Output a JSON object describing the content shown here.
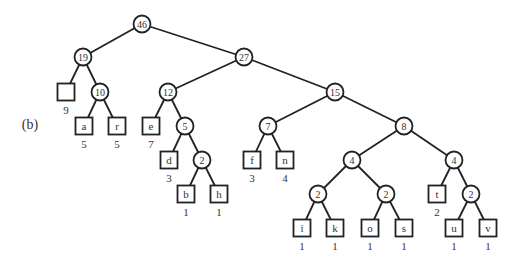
{
  "figure": {
    "part_label": "(b)",
    "kind": "Huffman tree",
    "nodes": [
      {
        "id": "n46",
        "type": "internal",
        "value": "46",
        "x": 142,
        "y": 24
      },
      {
        "id": "n19",
        "type": "internal",
        "value": "19",
        "x": 83,
        "y": 57
      },
      {
        "id": "n27",
        "type": "internal",
        "value": "27",
        "x": 244,
        "y": 57
      },
      {
        "id": "blank",
        "type": "leaf",
        "symbol": "",
        "weight": "9",
        "x": 66,
        "y": 92
      },
      {
        "id": "n10",
        "type": "internal",
        "value": "10",
        "x": 100,
        "y": 92
      },
      {
        "id": "a",
        "type": "leaf",
        "symbol": "a",
        "weight": "5",
        "x": 84,
        "y": 126
      },
      {
        "id": "r",
        "type": "leaf",
        "symbol": "r",
        "weight": "5",
        "x": 117,
        "y": 126
      },
      {
        "id": "n12",
        "type": "internal",
        "value": "12",
        "x": 168,
        "y": 92
      },
      {
        "id": "e",
        "type": "leaf",
        "symbol": "e",
        "weight": "7",
        "x": 151,
        "y": 126
      },
      {
        "id": "n5",
        "type": "internal",
        "value": "5",
        "x": 185,
        "y": 126
      },
      {
        "id": "d",
        "type": "leaf",
        "symbol": "d",
        "weight": "3",
        "x": 169,
        "y": 160
      },
      {
        "id": "n2a",
        "type": "internal",
        "value": "2",
        "x": 202,
        "y": 160
      },
      {
        "id": "b",
        "type": "leaf",
        "symbol": "b",
        "weight": "1",
        "x": 186,
        "y": 194
      },
      {
        "id": "h",
        "type": "leaf",
        "symbol": "h",
        "weight": "1",
        "x": 219,
        "y": 194
      },
      {
        "id": "n15",
        "type": "internal",
        "value": "15",
        "x": 335,
        "y": 92
      },
      {
        "id": "n7",
        "type": "internal",
        "value": "7",
        "x": 268,
        "y": 126
      },
      {
        "id": "f",
        "type": "leaf",
        "symbol": "f",
        "weight": "3",
        "x": 252,
        "y": 160
      },
      {
        "id": "n",
        "type": "leaf",
        "symbol": "n",
        "weight": "4",
        "x": 285,
        "y": 160
      },
      {
        "id": "n8",
        "type": "internal",
        "value": "8",
        "x": 404,
        "y": 126
      },
      {
        "id": "n4a",
        "type": "internal",
        "value": "4",
        "x": 352,
        "y": 160
      },
      {
        "id": "n4b",
        "type": "internal",
        "value": "4",
        "x": 454,
        "y": 160
      },
      {
        "id": "n2b",
        "type": "internal",
        "value": "2",
        "x": 318,
        "y": 194
      },
      {
        "id": "n2c",
        "type": "internal",
        "value": "2",
        "x": 386,
        "y": 194
      },
      {
        "id": "t",
        "type": "leaf",
        "symbol": "t",
        "weight": "2",
        "x": 437,
        "y": 194
      },
      {
        "id": "n2d",
        "type": "internal",
        "value": "2",
        "x": 471,
        "y": 194
      },
      {
        "id": "i",
        "type": "leaf",
        "symbol": "i",
        "weight": "1",
        "x": 302,
        "y": 228
      },
      {
        "id": "k",
        "type": "leaf",
        "symbol": "k",
        "weight": "1",
        "x": 335,
        "y": 228
      },
      {
        "id": "o",
        "type": "leaf",
        "symbol": "o",
        "weight": "1",
        "x": 370,
        "y": 228
      },
      {
        "id": "s",
        "type": "leaf",
        "symbol": "s",
        "weight": "1",
        "x": 404,
        "y": 228
      },
      {
        "id": "u",
        "type": "leaf",
        "symbol": "u",
        "weight": "1",
        "x": 454,
        "y": 228
      },
      {
        "id": "v",
        "type": "leaf",
        "symbol": "v",
        "weight": "1",
        "x": 488,
        "y": 228
      }
    ],
    "edges": [
      [
        "n46",
        "n19"
      ],
      [
        "n46",
        "n27"
      ],
      [
        "n19",
        "blank"
      ],
      [
        "n19",
        "n10"
      ],
      [
        "n10",
        "a"
      ],
      [
        "n10",
        "r"
      ],
      [
        "n27",
        "n12"
      ],
      [
        "n27",
        "n15"
      ],
      [
        "n12",
        "e"
      ],
      [
        "n12",
        "n5"
      ],
      [
        "n5",
        "d"
      ],
      [
        "n5",
        "n2a"
      ],
      [
        "n2a",
        "b"
      ],
      [
        "n2a",
        "h"
      ],
      [
        "n15",
        "n7"
      ],
      [
        "n15",
        "n8"
      ],
      [
        "n7",
        "f"
      ],
      [
        "n7",
        "n"
      ],
      [
        "n8",
        "n4a"
      ],
      [
        "n8",
        "n4b"
      ],
      [
        "n4a",
        "n2b"
      ],
      [
        "n4a",
        "n2c"
      ],
      [
        "n2b",
        "i"
      ],
      [
        "n2b",
        "k"
      ],
      [
        "n2c",
        "o"
      ],
      [
        "n2c",
        "s"
      ],
      [
        "n4b",
        "t"
      ],
      [
        "n4b",
        "n2d"
      ],
      [
        "n2d",
        "u"
      ],
      [
        "n2d",
        "v"
      ]
    ]
  },
  "style": {
    "line_color": "#222222",
    "text_color": "#333333",
    "background": "#ffffff"
  }
}
